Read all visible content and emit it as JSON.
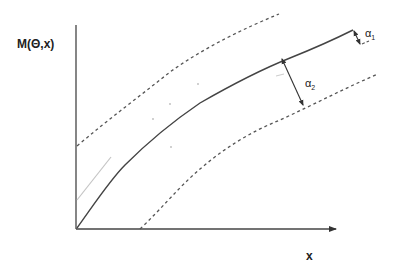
{
  "figure": {
    "y_axis_label": "M(Θ,x)",
    "x_axis_label": "x",
    "annotations": [
      {
        "symbol": "α",
        "subscript": "1",
        "meaning": "distance at upper end"
      },
      {
        "symbol": "α",
        "subscript": "2",
        "meaning": "distance between mean curve and lower bound"
      }
    ],
    "curves": [
      {
        "name": "mean-curve",
        "style": "solid"
      },
      {
        "name": "upper-bound",
        "style": "dashed"
      },
      {
        "name": "lower-bound",
        "style": "dashed"
      },
      {
        "name": "initial-tangent",
        "style": "light-gray"
      }
    ],
    "colors": {
      "ink": "#333333",
      "light": "#bbbbbb"
    }
  }
}
